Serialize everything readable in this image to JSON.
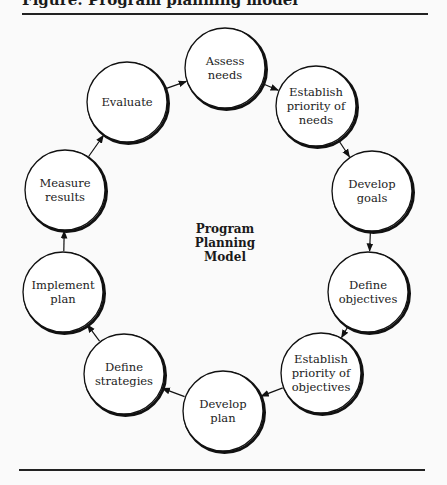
{
  "header": {
    "title": "Figure: Program planning model"
  },
  "diagram": {
    "center_label": "Program\nPlanning\nModel",
    "center_lines": [
      "Program",
      "Planning",
      "Model"
    ],
    "nodes": [
      {
        "id": "assess-needs",
        "lines": [
          "Assess",
          "needs"
        ],
        "cx": 225,
        "cy": 68
      },
      {
        "id": "establish-priority-needs",
        "lines": [
          "Establish",
          "priority of",
          "needs"
        ],
        "cx": 316,
        "cy": 106
      },
      {
        "id": "develop-goals",
        "lines": [
          "Develop",
          "goals"
        ],
        "cx": 372,
        "cy": 191
      },
      {
        "id": "define-objectives",
        "lines": [
          "Define",
          "objectives"
        ],
        "cx": 368,
        "cy": 292
      },
      {
        "id": "establish-priority-objectives",
        "lines": [
          "Establish",
          "priority of",
          "objectives"
        ],
        "cx": 321,
        "cy": 373
      },
      {
        "id": "develop-plan",
        "lines": [
          "Develop",
          "plan"
        ],
        "cx": 223,
        "cy": 411
      },
      {
        "id": "define-strategies",
        "lines": [
          "Define",
          "strategies"
        ],
        "cx": 124,
        "cy": 374
      },
      {
        "id": "implement-plan",
        "lines": [
          "Implement",
          "plan"
        ],
        "cx": 63,
        "cy": 292
      },
      {
        "id": "measure-results",
        "lines": [
          "Measure",
          "results"
        ],
        "cx": 65,
        "cy": 190
      },
      {
        "id": "evaluate",
        "lines": [
          "Evaluate"
        ],
        "cx": 127,
        "cy": 102
      }
    ],
    "edges": [
      [
        "assess-needs",
        "establish-priority-needs"
      ],
      [
        "establish-priority-needs",
        "develop-goals"
      ],
      [
        "develop-goals",
        "define-objectives"
      ],
      [
        "define-objectives",
        "establish-priority-objectives"
      ],
      [
        "establish-priority-objectives",
        "develop-plan"
      ],
      [
        "develop-plan",
        "define-strategies"
      ],
      [
        "define-strategies",
        "implement-plan"
      ],
      [
        "implement-plan",
        "measure-results"
      ],
      [
        "measure-results",
        "evaluate"
      ],
      [
        "evaluate",
        "assess-needs"
      ]
    ],
    "node_texts": {
      "n0_l0": "Assess",
      "n0_l1": "needs",
      "n1_l0": "Establish",
      "n1_l1": "priority of",
      "n1_l2": "needs",
      "n2_l0": "Develop",
      "n2_l1": "goals",
      "n3_l0": "Define",
      "n3_l1": "objectives",
      "n4_l0": "Establish",
      "n4_l1": "priority of",
      "n4_l2": "objectives",
      "n5_l0": "Develop",
      "n5_l1": "plan",
      "n6_l0": "Define",
      "n6_l1": "strategies",
      "n7_l0": "Implement",
      "n7_l1": "plan",
      "n8_l0": "Measure",
      "n8_l1": "results",
      "n9_l0": "Evaluate"
    }
  }
}
